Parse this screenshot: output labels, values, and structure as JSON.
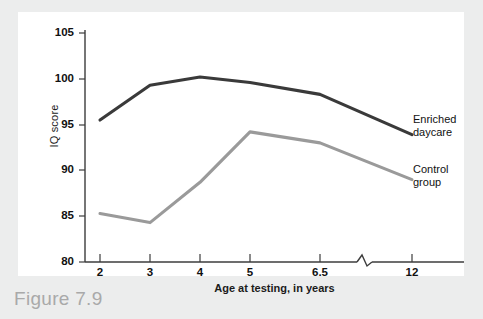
{
  "figure": {
    "caption": "Figure 7.9"
  },
  "chart_data": {
    "type": "line",
    "title": "",
    "xlabel": "Age at testing, in years",
    "ylabel": "IQ score",
    "categories": [
      "2",
      "3",
      "4",
      "5",
      "6.5",
      "12"
    ],
    "x_tick_labels": [
      "2",
      "3",
      "4",
      "5",
      "6.5",
      "12"
    ],
    "y_tick_labels": [
      "80",
      "85",
      "90",
      "95",
      "100",
      "105"
    ],
    "ylim": [
      80,
      105
    ],
    "y_tick_step": 5,
    "grid": false,
    "axis_break": true,
    "axis_break_note": "zigzag break in x-axis between 6.5 and 12",
    "legend_position": "right-of-plot",
    "series": [
      {
        "name": "Enriched daycare",
        "label_line1": "Enriched",
        "label_line2": "daycare",
        "color": "#3a3a3a",
        "values": [
          95.5,
          99.3,
          100.2,
          99.6,
          98.3,
          93.9
        ]
      },
      {
        "name": "Control group",
        "label_line1": "Control",
        "label_line2": "group",
        "color": "#9a9a9a",
        "values": [
          85.3,
          84.3,
          88.7,
          94.2,
          93.0,
          89.0
        ]
      }
    ]
  },
  "colors": {
    "page_background": "#eceded",
    "panel_background": "#ffffff",
    "axis": "#3c3c3c",
    "enriched_daycare": "#3a3a3a",
    "control_group": "#9a9a9a",
    "caption_text": "#a9a9a9"
  }
}
